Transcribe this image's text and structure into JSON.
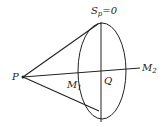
{
  "diagram": {
    "labels": {
      "surface": {
        "main": "S",
        "sub": "p",
        "rest": "=0"
      },
      "point_p": "P",
      "point_m1": {
        "main": "M",
        "sub": "1"
      },
      "point_q": "Q",
      "point_m2": {
        "main": "M",
        "sub": "2"
      }
    },
    "geometry": {
      "P": [
        23,
        77
      ],
      "ellipse_center": [
        102,
        71
      ],
      "ellipse_rx": 24,
      "ellipse_ry": 48,
      "M2_end": [
        140,
        68
      ]
    },
    "colors": {
      "stroke": "#222222",
      "background": "#ffffff"
    }
  }
}
